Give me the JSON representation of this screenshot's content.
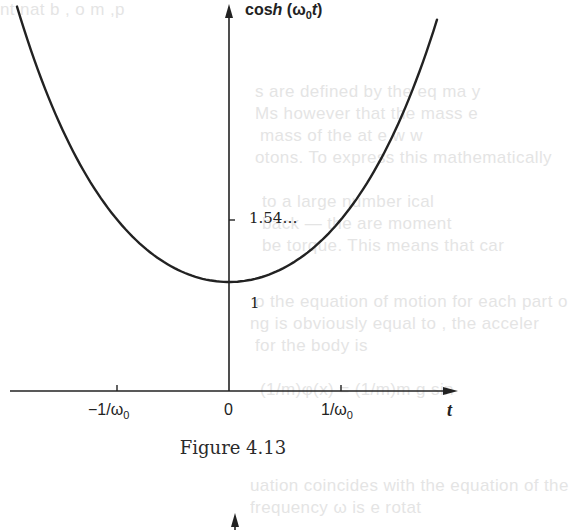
{
  "figure": {
    "caption": "Figure 4.13",
    "y_axis_label": {
      "prefix": "cos",
      "italic": "h",
      "open": " (",
      "omega": "ω",
      "sub": "0",
      "var": "t",
      "close": ")"
    },
    "x_axis_label": "t",
    "y_ticks": [
      {
        "label": "1.54…",
        "value": 1.54
      },
      {
        "label": "1",
        "value": 1
      }
    ],
    "x_ticks": [
      {
        "label_main": "−1/ω",
        "label_sub": "0",
        "value": -1
      },
      {
        "label_main": "0",
        "label_sub": "",
        "value": 0
      },
      {
        "label_main": "1/ω",
        "label_sub": "0",
        "value": 1
      }
    ]
  },
  "colors": {
    "ink": "#222222",
    "background": "#ffffff",
    "bleed_through": "#cfcfcf"
  },
  "chart_data": {
    "type": "line",
    "title": "Figure 4.13",
    "function": "cosh(ω0 t)",
    "xlabel": "t",
    "ylabel": "cosh (ω0 t)",
    "x_unit": "1/ω0",
    "x_tick_labels": [
      "−1/ω0",
      "0",
      "1/ω0"
    ],
    "y_tick_labels": [
      "1",
      "1.54…"
    ],
    "xlim": [
      -1.9,
      2.0
    ],
    "ylim": [
      0,
      3.4
    ],
    "grid": false,
    "legend": null,
    "annotations": [
      "minimum value 1 at t = 0",
      "cosh(1) = 1.54…"
    ],
    "x": [
      -1.9,
      -1.5,
      -1.0,
      -0.5,
      0,
      0.5,
      1.0,
      1.5,
      1.9
    ],
    "y": [
      3.42,
      2.35,
      1.54,
      1.13,
      1.0,
      1.13,
      1.54,
      2.35,
      3.42
    ]
  }
}
